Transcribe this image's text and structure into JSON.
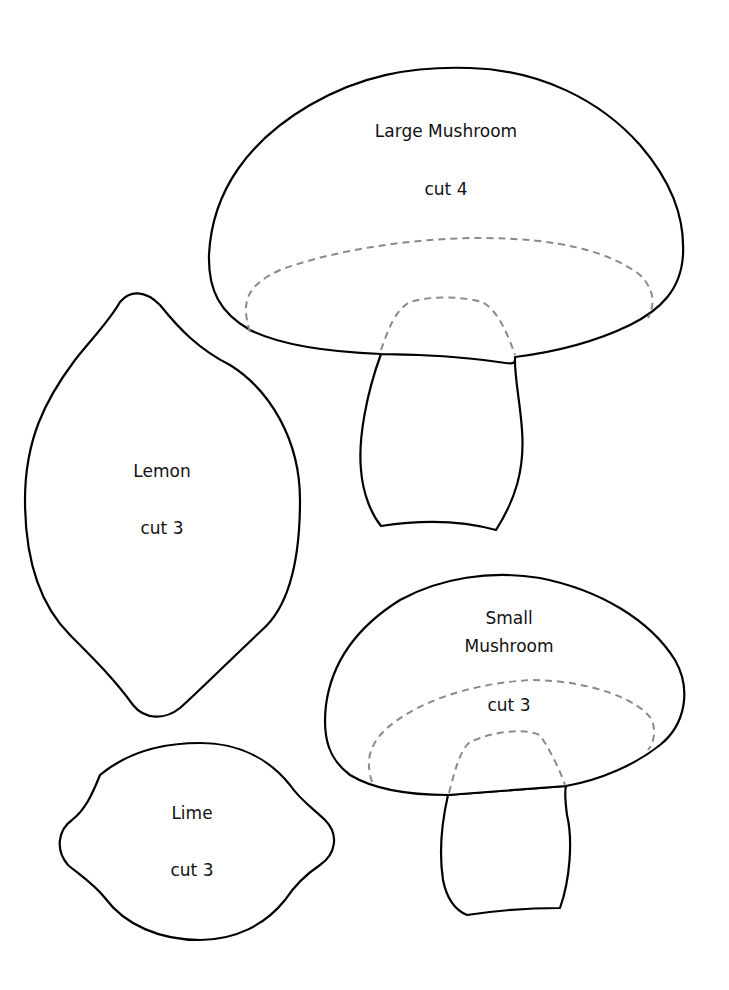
{
  "shapes": {
    "large_mushroom": {
      "title": "Large Mushroom",
      "instruction": "cut 4"
    },
    "lemon": {
      "title": "Lemon",
      "instruction": "cut 3"
    },
    "small_mushroom": {
      "title_line1": "Small",
      "title_line2": "Mushroom",
      "instruction": "cut 3"
    },
    "lime": {
      "title": "Lime",
      "instruction": "cut 3"
    }
  },
  "colors": {
    "outline": "#000000",
    "placement_guide": "#8a8a8a",
    "background": "#ffffff"
  }
}
